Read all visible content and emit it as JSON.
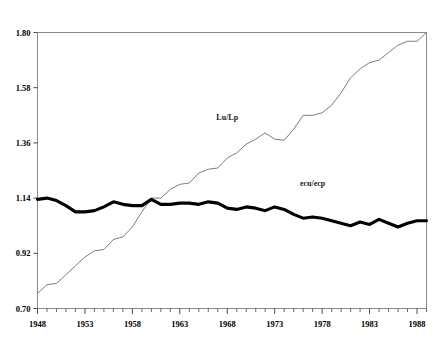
{
  "chart_data": {
    "type": "line",
    "title": "",
    "subtitle": "",
    "xlabel": "",
    "ylabel": "",
    "xlim": [
      1948,
      1989
    ],
    "ylim": [
      0.7,
      1.8
    ],
    "grid": false,
    "legend_position": "inline-annotation",
    "y_ticks": [
      "1.80",
      "1.58",
      "1.36",
      "1.14",
      "0.92",
      "0.70"
    ],
    "y_tick_values": [
      1.8,
      1.58,
      1.36,
      1.14,
      0.92,
      0.7
    ],
    "x_ticks": [
      "1948",
      "1953",
      "1958",
      "1963",
      "1968",
      "1973",
      "1978",
      "1983",
      "1988"
    ],
    "x_tick_values": [
      1948,
      1953,
      1958,
      1963,
      1968,
      1973,
      1978,
      1983,
      1988
    ],
    "x_minor_tick_interval": 1,
    "annotations": [
      {
        "text": "Lu/Lp",
        "x": 1968,
        "y": 1.45
      },
      {
        "text": "ecu/ecp",
        "x": 1977,
        "y": 1.19
      }
    ],
    "x": [
      1948,
      1949,
      1950,
      1951,
      1952,
      1953,
      1954,
      1955,
      1956,
      1957,
      1958,
      1959,
      1960,
      1961,
      1962,
      1963,
      1964,
      1965,
      1966,
      1967,
      1968,
      1969,
      1970,
      1971,
      1972,
      1973,
      1974,
      1975,
      1976,
      1977,
      1978,
      1979,
      1980,
      1981,
      1982,
      1983,
      1984,
      1985,
      1986,
      1987,
      1988,
      1989
    ],
    "series": [
      {
        "name": "Lu/Lp",
        "style": "thin",
        "color": "#6e6e6e",
        "values": [
          0.76,
          0.795,
          0.8,
          0.835,
          0.87,
          0.905,
          0.93,
          0.935,
          0.975,
          0.985,
          1.025,
          1.085,
          1.14,
          1.14,
          1.175,
          1.195,
          1.2,
          1.24,
          1.255,
          1.26,
          1.3,
          1.32,
          1.355,
          1.375,
          1.4,
          1.375,
          1.37,
          1.415,
          1.47,
          1.47,
          1.48,
          1.51,
          1.56,
          1.62,
          1.655,
          1.68,
          1.69,
          1.72,
          1.75,
          1.765,
          1.765,
          1.8
        ]
      },
      {
        "name": "ecu/ecp",
        "style": "thick",
        "color": "#000000",
        "values": [
          1.135,
          1.14,
          1.13,
          1.11,
          1.085,
          1.085,
          1.09,
          1.105,
          1.125,
          1.115,
          1.11,
          1.11,
          1.135,
          1.115,
          1.115,
          1.12,
          1.12,
          1.115,
          1.125,
          1.12,
          1.1,
          1.095,
          1.105,
          1.1,
          1.09,
          1.105,
          1.095,
          1.075,
          1.06,
          1.065,
          1.06,
          1.05,
          1.04,
          1.03,
          1.045,
          1.035,
          1.055,
          1.04,
          1.025,
          1.04,
          1.05,
          1.05
        ]
      }
    ]
  }
}
